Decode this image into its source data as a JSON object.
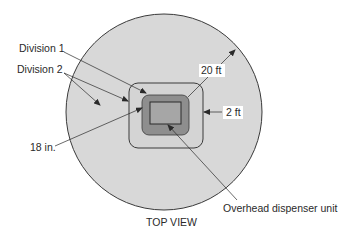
{
  "diagram": {
    "caption": "TOP VIEW",
    "labels": {
      "division1": "Division 1",
      "division2": "Division 2",
      "dim_18in": "18 in.",
      "dim_20ft": "20 ft",
      "dim_2ft": "2 ft",
      "dispenser": "Overhead dispenser unit"
    },
    "colors": {
      "outer_circle_fill": "#d8d8d8",
      "outer_square_fill": "#d4d4d4",
      "dispenser_housing_fill": "#8e8e8e",
      "dispenser_unit_fill": "#a6a6a6",
      "stroke": "#3a3a3a"
    }
  }
}
